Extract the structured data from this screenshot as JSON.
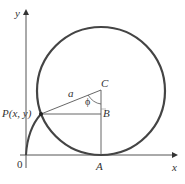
{
  "diagram": {
    "labels": {
      "y_axis": "y",
      "x_axis": "x",
      "origin": "0",
      "point_p": "P(x, y)",
      "point_a": "A",
      "point_b": "B",
      "point_c": "C",
      "radius": "a",
      "angle": "ϕ"
    },
    "colors": {
      "curve": "#333333",
      "axis": "#555555",
      "line": "#555555"
    }
  }
}
